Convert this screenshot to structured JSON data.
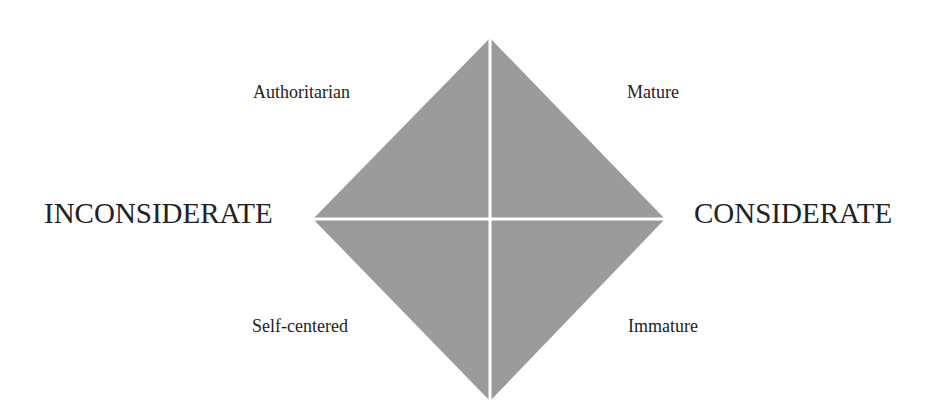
{
  "diagram": {
    "type": "quadrant-diamond",
    "fill_color": "#9b9b9b",
    "divider_color": "#ffffff",
    "axis": {
      "left_label": "INCONSIDERATE",
      "right_label": "CONSIDERATE"
    },
    "quadrants": {
      "top_left": "Authoritarian",
      "top_right": "Mature",
      "bottom_left": "Self-centered",
      "bottom_right": "Immature"
    }
  }
}
